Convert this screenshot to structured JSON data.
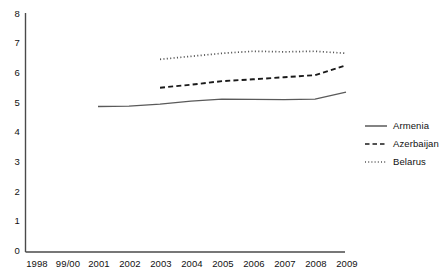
{
  "chart_data": {
    "type": "line",
    "title": "",
    "subtitle": "",
    "xlabel": "",
    "ylabel": "",
    "ylim": [
      0,
      8
    ],
    "yticks": [
      0,
      1,
      2,
      3,
      4,
      5,
      6,
      7,
      8
    ],
    "grid": false,
    "legend_position": "right",
    "categories": [
      "1998",
      "99/00",
      "2001",
      "2002",
      "2003",
      "2004",
      "2005",
      "2006",
      "2007",
      "2008",
      "2009"
    ],
    "series": [
      {
        "name": "Armenia",
        "style": "solid",
        "color": "#5a5a5a",
        "values": [
          null,
          null,
          4.87,
          4.88,
          4.95,
          5.05,
          5.12,
          5.11,
          5.1,
          5.12,
          5.35
        ]
      },
      {
        "name": "Azerbaijan",
        "style": "dashed",
        "color": "#1a1a1a",
        "values": [
          null,
          null,
          null,
          null,
          5.5,
          5.6,
          5.72,
          5.78,
          5.85,
          5.92,
          6.25
        ]
      },
      {
        "name": "Belarus",
        "style": "dotted",
        "color": "#555555",
        "values": [
          null,
          null,
          null,
          null,
          6.45,
          6.55,
          6.65,
          6.72,
          6.7,
          6.72,
          6.65
        ]
      }
    ]
  },
  "axes": {
    "y_tick_labels": [
      "8",
      "7",
      "6",
      "5",
      "4",
      "3",
      "2",
      "1",
      "0"
    ],
    "x_tick_labels": [
      "1998",
      "99/00",
      "2001",
      "2002",
      "2003",
      "2004",
      "2005",
      "2006",
      "2007",
      "2008",
      "2009"
    ]
  },
  "legend": {
    "items": [
      {
        "label": "Armenia",
        "style": "solid"
      },
      {
        "label": "Azerbaijan",
        "style": "dashed"
      },
      {
        "label": "Belarus",
        "style": "dotted"
      }
    ]
  },
  "caption": {
    "text": ""
  },
  "colors": {
    "axis": "#4a4a4a",
    "armenia": "#5a5a5a",
    "azerbaijan": "#1a1a1a",
    "belarus": "#555555",
    "text": "#111111",
    "background": "#ffffff"
  }
}
